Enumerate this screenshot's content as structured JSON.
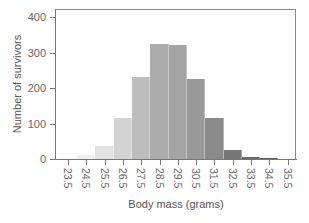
{
  "chart_data": {
    "type": "bar",
    "title": "",
    "xlabel": "Body mass (grams)",
    "ylabel": "Number of survivors",
    "categories": [
      "23.5",
      "24.5",
      "25.5",
      "26.5",
      "27.5",
      "28.5",
      "29.5",
      "30.5",
      "31.5",
      "32.5",
      "33.5",
      "34.5",
      "35.5"
    ],
    "values": [
      2,
      10,
      37,
      115,
      231,
      324,
      321,
      225,
      115,
      25,
      5,
      2,
      1
    ],
    "colors": [
      "#f7f7f7",
      "#efefef",
      "#e3e3e3",
      "#d3d3d3",
      "#bdbdbd",
      "#acacac",
      "#a4a4a4",
      "#999999",
      "#8a8a8a",
      "#777777",
      "#6a6a6a",
      "#5e5e5e",
      "#555555"
    ],
    "ylim": [
      0,
      400
    ],
    "yticks": [
      0,
      100,
      200,
      300,
      400
    ],
    "grid": false,
    "legend": null
  },
  "axes": {
    "xlabel": "Body mass (grams)",
    "ylabel": "Number of survivors",
    "yticks": [
      "0",
      "100",
      "200",
      "300",
      "400"
    ]
  }
}
